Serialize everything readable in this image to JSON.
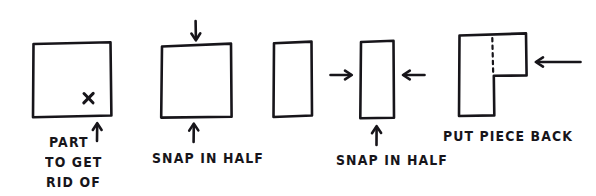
{
  "figure": {
    "type": "hand-drawn-instruction-diagram",
    "background_color": "#ffffff",
    "ink_color": "#17151a",
    "panel_count": 5
  },
  "panels": [
    {
      "id": "panel-1",
      "shape": "square",
      "marker": "x-mark",
      "caption_lines": [
        "PART",
        "TO GET",
        "RID OF"
      ],
      "arrows": [
        "up-arrow"
      ]
    },
    {
      "id": "panel-2",
      "shape": "square",
      "caption": "SNAP IN HALF",
      "arrows": [
        "down-arrow",
        "up-arrow"
      ]
    },
    {
      "id": "panel-3",
      "shape": "vertical-rectangle",
      "caption": "",
      "arrows": []
    },
    {
      "id": "panel-4",
      "shape": "vertical-rectangle",
      "caption": "SNAP IN HALF",
      "arrows": [
        "right-arrow",
        "left-arrow",
        "up-arrow"
      ]
    },
    {
      "id": "panel-5",
      "shape": "l-shape-with-dashed-seam",
      "caption": "PUT PIECE BACK",
      "arrows": [
        "left-arrow"
      ]
    }
  ],
  "labels": {
    "part_line1": "PART",
    "part_line2": "TO GET",
    "part_line3": "RID OF",
    "snap_in_half_1": "SNAP IN HALF",
    "snap_in_half_2": "SNAP IN HALF",
    "put_piece_back": "PUT PIECE BACK"
  },
  "icons": {
    "x_mark": "×"
  }
}
